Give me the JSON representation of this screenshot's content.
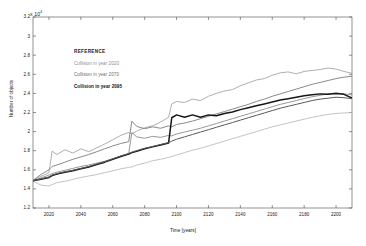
{
  "chart_data": {
    "type": "line",
    "title": "",
    "xlabel": "Time [years]",
    "ylabel": "Number of objects",
    "y_exponent_label": "x 10",
    "y_exponent_power": "4",
    "xlim": [
      2010,
      2210
    ],
    "ylim": [
      12000,
      32000
    ],
    "grid": false,
    "legend_position": "upper-left-inside",
    "xticks": [
      "2020",
      "2040",
      "2060",
      "2080",
      "2100",
      "2120",
      "2140",
      "2160",
      "2180",
      "2200"
    ],
    "xtick_values": [
      2020,
      2040,
      2060,
      2080,
      2100,
      2120,
      2140,
      2160,
      2180,
      2200
    ],
    "yticks": [
      "1.2",
      "1.4",
      "1.6",
      "1.8",
      "2",
      "2.2",
      "2.4",
      "2.6",
      "2.8",
      "3",
      "3.2"
    ],
    "ytick_values": [
      12000,
      14000,
      16000,
      18000,
      20000,
      22000,
      24000,
      26000,
      28000,
      30000,
      32000
    ],
    "legend": [
      {
        "label": "REFERENCE",
        "color": "#1a1a1a",
        "bold": true,
        "is_heading": true
      },
      {
        "label": "Collision in year 2020",
        "color": "#8f8f8f",
        "bold": false,
        "is_heading": false
      },
      {
        "label": "Collision in year 2070",
        "color": "#6e6e6e",
        "bold": false,
        "is_heading": false
      },
      {
        "label": "Collision in year 2095",
        "color": "#111111",
        "bold": true,
        "is_heading": false
      }
    ],
    "x": [
      2010,
      2015,
      2020,
      2022,
      2025,
      2030,
      2035,
      2040,
      2045,
      2050,
      2055,
      2060,
      2065,
      2070,
      2072,
      2075,
      2080,
      2085,
      2090,
      2095,
      2097,
      2100,
      2105,
      2110,
      2115,
      2120,
      2125,
      2130,
      2135,
      2140,
      2145,
      2150,
      2155,
      2160,
      2165,
      2170,
      2175,
      2180,
      2185,
      2190,
      2195,
      2200,
      2205,
      2210
    ],
    "series": [
      {
        "name": "Collision in year 2020 - upper",
        "color": "#9a9a9a",
        "width": 0.8,
        "values": [
          14900,
          15300,
          15700,
          17950,
          17600,
          18100,
          17750,
          18200,
          17900,
          18300,
          18700,
          19150,
          19600,
          19900,
          19750,
          20050,
          20400,
          20600,
          21000,
          21500,
          22900,
          23150,
          23050,
          23400,
          23250,
          23700,
          24000,
          24250,
          24400,
          24800,
          25100,
          25400,
          25550,
          25900,
          26150,
          26250,
          26050,
          26300,
          26400,
          26500,
          26650,
          26550,
          26300,
          26100
        ]
      },
      {
        "name": "Collision in year 2020 - lower",
        "color": "#b4b4b4",
        "width": 0.8,
        "values": [
          14800,
          14400,
          14300,
          14450,
          14650,
          14800,
          15000,
          15200,
          15350,
          15500,
          15700,
          15900,
          16100,
          16250,
          16300,
          16500,
          16700,
          16950,
          17100,
          17300,
          17400,
          17550,
          17800,
          18050,
          18250,
          18500,
          18750,
          19000,
          19250,
          19500,
          19750,
          20000,
          20250,
          20500,
          20700,
          20900,
          21100,
          21300,
          21500,
          21650,
          21800,
          21900,
          21950,
          22000
        ]
      },
      {
        "name": "Collision in year 2070 - upper",
        "color": "#7d7d7d",
        "width": 0.9,
        "values": [
          14900,
          15500,
          16000,
          16350,
          16500,
          16800,
          17100,
          17350,
          17600,
          17900,
          18200,
          18500,
          18750,
          18950,
          21100,
          20550,
          20300,
          20500,
          20350,
          20600,
          20500,
          20750,
          20900,
          21100,
          21350,
          21600,
          21850,
          22100,
          22350,
          22600,
          22850,
          23150,
          23400,
          23700,
          23950,
          24200,
          24450,
          24700,
          24950,
          25150,
          25350,
          25550,
          25700,
          25800
        ]
      },
      {
        "name": "Collision in year 2070 - lower",
        "color": "#8c8c8c",
        "width": 0.9,
        "values": [
          14850,
          15150,
          15450,
          15600,
          15750,
          15950,
          16150,
          16350,
          16500,
          16700,
          16900,
          17150,
          17400,
          17700,
          19900,
          19450,
          19300,
          19500,
          19400,
          19600,
          19550,
          19750,
          19950,
          20150,
          20350,
          20600,
          20850,
          21100,
          21350,
          21600,
          21850,
          22100,
          22350,
          22600,
          22850,
          23050,
          23250,
          23450,
          23650,
          23800,
          23950,
          24050,
          23950,
          23850
        ]
      },
      {
        "name": "Collision in year 2095 - mean",
        "color": "#161616",
        "width": 1.5,
        "values": [
          14850,
          15000,
          15200,
          15400,
          15550,
          15750,
          15900,
          16100,
          16300,
          16550,
          16800,
          17100,
          17400,
          17650,
          17800,
          17950,
          18200,
          18400,
          18600,
          18800,
          21450,
          21750,
          21500,
          21750,
          21500,
          21750,
          21650,
          21900,
          22050,
          22300,
          22500,
          22700,
          22900,
          23100,
          23300,
          23450,
          23600,
          23750,
          23850,
          23950,
          23900,
          24000,
          23900,
          23500
        ]
      },
      {
        "name": "Collision in year 2095 - lower band",
        "color": "#5a5a5a",
        "width": 1.0,
        "values": [
          14850,
          15050,
          15250,
          15450,
          15600,
          15800,
          15950,
          16150,
          16350,
          16600,
          16850,
          17150,
          17450,
          17700,
          17850,
          18000,
          18250,
          18450,
          18650,
          18850,
          19000,
          19200,
          19450,
          19700,
          19950,
          20200,
          20450,
          20700,
          20950,
          21200,
          21450,
          21700,
          21950,
          22200,
          22450,
          22650,
          22850,
          23050,
          23250,
          23400,
          23500,
          23600,
          23550,
          23450
        ]
      }
    ]
  }
}
